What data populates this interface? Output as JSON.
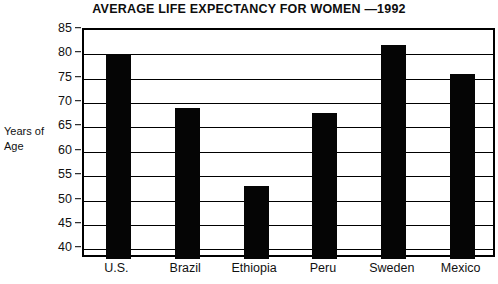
{
  "chart_data": {
    "type": "bar",
    "title": "AVERAGE LIFE EXPECTANCY FOR WOMEN —1992",
    "categories": [
      "U.S.",
      "Brazil",
      "Ethiopia",
      "Peru",
      "Sweden",
      "Mexico"
    ],
    "values": [
      80,
      69,
      53,
      68,
      82,
      76
    ],
    "xlabel": "",
    "ylabel": "Years of Age",
    "ylabel_lines": [
      "Years of",
      "Age"
    ],
    "ylim": [
      38,
      85
    ],
    "yticks": [
      85,
      80,
      75,
      70,
      65,
      60,
      55,
      50,
      45,
      40
    ],
    "ytick_labels": [
      "85",
      "80",
      "75",
      "70",
      "65",
      "60",
      "55",
      "50",
      "45",
      "40"
    ],
    "grid": true,
    "grid_axis": "y",
    "legend": false,
    "bar_color": "#050505",
    "background_color": "#ffffff",
    "axis_color": "#000000"
  }
}
